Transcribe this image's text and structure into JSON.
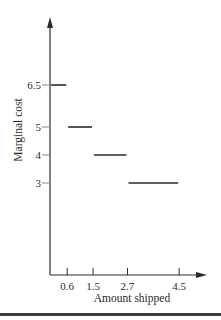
{
  "chart_data": {
    "type": "line",
    "subtype": "step-segments",
    "title": "",
    "xlabel": "Amount shipped",
    "ylabel": "Marginal cost",
    "xticks": [
      0.6,
      1.5,
      2.7,
      4.5
    ],
    "xtick_labels": [
      "0.6",
      "1.5",
      "2.7",
      "4.5"
    ],
    "yticks": [
      3,
      4,
      5,
      6.5
    ],
    "ytick_labels": [
      "3",
      "4",
      "5",
      "6.5"
    ],
    "xlim": [
      0,
      5
    ],
    "ylim": [
      0,
      8.5
    ],
    "grid": false,
    "legend": "none",
    "series": [
      {
        "name": "marginal cost",
        "segments": [
          {
            "x0": 0,
            "x1": 0.6,
            "y": 6.5
          },
          {
            "x0": 0.6,
            "x1": 1.5,
            "y": 5
          },
          {
            "x0": 1.5,
            "x1": 2.7,
            "y": 4
          },
          {
            "x0": 2.7,
            "x1": 4.5,
            "y": 3
          }
        ]
      }
    ],
    "colors": {
      "ink": "#2a2a2a"
    }
  }
}
